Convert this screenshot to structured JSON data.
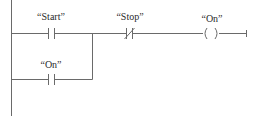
{
  "diagram": {
    "type": "ladder-logic",
    "line_color": "#6a6a6a",
    "rungs": [
      {
        "id": "rung-1",
        "elements": [
          {
            "kind": "no-contact",
            "label": "“Start”"
          },
          {
            "kind": "nc-contact",
            "label": "“Stop”"
          },
          {
            "kind": "coil",
            "label": "“On”"
          }
        ]
      },
      {
        "id": "branch-1",
        "parallel_to": "Start",
        "elements": [
          {
            "kind": "no-contact",
            "label": "“On”"
          }
        ]
      }
    ]
  },
  "labels": {
    "start": "“Start”",
    "stop": "“Stop”",
    "coil_on": "“On”",
    "seal_on": "“On”"
  }
}
